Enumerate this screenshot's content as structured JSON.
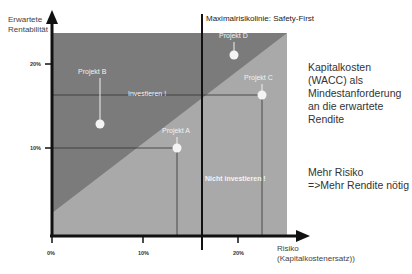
{
  "y_axis": {
    "label_line1": "Erwartete",
    "label_line2": "Rentabilität",
    "ticks": [
      "20%",
      "10%"
    ]
  },
  "x_axis": {
    "label_line1": "Risiko",
    "label_line2": "(Kapitalkostenersatz))",
    "ticks": [
      "0%",
      "10%",
      "20%"
    ]
  },
  "max_risk_line": {
    "label": "Maximalrisikolinie: Safety-First"
  },
  "zones": {
    "invest": "Investieren !",
    "no_invest": "Nicht investieren !"
  },
  "projects": [
    {
      "name": "Projekt A"
    },
    {
      "name": "Projekt B"
    },
    {
      "name": "Projekt C"
    },
    {
      "name": "Projekt D"
    }
  ],
  "side_notes": {
    "wacc_lines": [
      "Kapitalkosten",
      "(WACC) als",
      "Mindestanforderung",
      "an die erwartete",
      "Rendite"
    ],
    "risk_lines": [
      "Mehr Risiko",
      "=>Mehr Rendite nötig"
    ]
  },
  "colors": {
    "dark_zone": "#7b7b7b",
    "light_zone": "#a9a9a9",
    "axis": "#111111"
  }
}
